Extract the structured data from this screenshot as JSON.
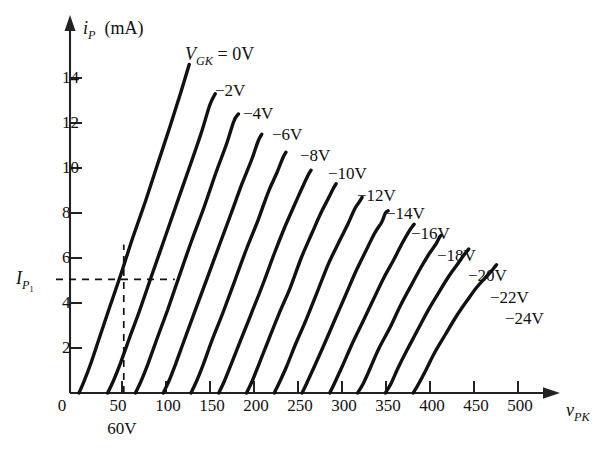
{
  "chart_data": {
    "type": "line",
    "title": "",
    "xlabel": "v_PK",
    "ylabel": "i_P (mA)",
    "xlim": [
      0,
      540
    ],
    "ylim": [
      0,
      15.5
    ],
    "grid": false,
    "legend": "inline-curve-labels",
    "x_axis_label_html": "v<sub>PK</sub>",
    "y_axis_label_html": "i<sub>P</sub> (mA)",
    "x_ticks": [
      0,
      50,
      100,
      150,
      200,
      250,
      300,
      350,
      400,
      450,
      500
    ],
    "y_ticks": [
      0,
      2,
      4,
      6,
      8,
      10,
      12,
      14
    ],
    "x_tick_labels": [
      "0",
      "50",
      "100",
      "150",
      "200",
      "250",
      "300",
      "350",
      "400",
      "450",
      "500"
    ],
    "y_tick_labels": [
      "0",
      "2",
      "4",
      "6",
      "8",
      "10",
      "12",
      "14"
    ],
    "parameter_name": "V_GK",
    "parameter_label_html": "V<sub>GK</sub> = 0V",
    "annotations": [
      {
        "name": "operating-point-voltage",
        "text": "60V",
        "x": 60,
        "y": 0
      },
      {
        "name": "operating-point-current",
        "text": "I_P1",
        "html": "I<sub>P<sub>1</sub></sub>",
        "x": 0,
        "y": 5.05
      }
    ],
    "construction_lines": {
      "vertical_x": 60,
      "horizontal_y": 5.05,
      "horizontal_x_end": 117
    },
    "series": [
      {
        "name": "0V",
        "label": "V_GK = 0V",
        "label_x": 185,
        "label_y": 44,
        "points": [
          [
            10,
            0
          ],
          [
            16,
            0.55
          ],
          [
            24,
            1.4
          ],
          [
            34,
            2.6
          ],
          [
            45,
            3.9
          ],
          [
            57,
            5.3
          ],
          [
            70,
            6.9
          ],
          [
            84,
            8.5
          ],
          [
            98,
            10.2
          ],
          [
            112,
            11.9
          ],
          [
            124,
            13.4
          ],
          [
            133,
            14.6
          ]
        ]
      },
      {
        "name": "-2V",
        "label": "−2V",
        "label_x": 215,
        "label_y": 81,
        "points": [
          [
            42,
            0
          ],
          [
            48,
            0.5
          ],
          [
            56,
            1.3
          ],
          [
            66,
            2.4
          ],
          [
            78,
            3.7
          ],
          [
            91,
            5.2
          ],
          [
            105,
            6.8
          ],
          [
            119,
            8.4
          ],
          [
            133,
            10.0
          ],
          [
            146,
            11.5
          ],
          [
            156,
            12.8
          ],
          [
            162,
            13.3
          ]
        ]
      },
      {
        "name": "-4V",
        "label": "−4V",
        "label_x": 243,
        "label_y": 104,
        "points": [
          [
            73,
            0
          ],
          [
            79,
            0.5
          ],
          [
            87,
            1.3
          ],
          [
            97,
            2.4
          ],
          [
            109,
            3.7
          ],
          [
            122,
            5.2
          ],
          [
            136,
            6.8
          ],
          [
            150,
            8.3
          ],
          [
            163,
            9.8
          ],
          [
            175,
            11.1
          ],
          [
            183,
            12.1
          ],
          [
            188,
            12.4
          ]
        ]
      },
      {
        "name": "-6V",
        "label": "−6V",
        "label_x": 272,
        "label_y": 125,
        "points": [
          [
            104,
            0
          ],
          [
            110,
            0.5
          ],
          [
            118,
            1.3
          ],
          [
            128,
            2.4
          ],
          [
            140,
            3.7
          ],
          [
            153,
            5.1
          ],
          [
            167,
            6.6
          ],
          [
            180,
            8.0
          ],
          [
            192,
            9.3
          ],
          [
            203,
            10.4
          ],
          [
            210,
            11.2
          ],
          [
            214,
            11.5
          ]
        ]
      },
      {
        "name": "-8V",
        "label": "−8V",
        "label_x": 300,
        "label_y": 146,
        "points": [
          [
            135,
            0
          ],
          [
            141,
            0.5
          ],
          [
            149,
            1.3
          ],
          [
            159,
            2.4
          ],
          [
            171,
            3.6
          ],
          [
            184,
            5.0
          ],
          [
            197,
            6.4
          ],
          [
            210,
            7.7
          ],
          [
            221,
            8.9
          ],
          [
            231,
            9.8
          ],
          [
            237,
            10.4
          ],
          [
            241,
            10.7
          ]
        ]
      },
      {
        "name": "-10V",
        "label": "−10V",
        "label_x": 328,
        "label_y": 164,
        "points": [
          [
            166,
            0
          ],
          [
            172,
            0.5
          ],
          [
            180,
            1.3
          ],
          [
            190,
            2.3
          ],
          [
            202,
            3.5
          ],
          [
            215,
            4.8
          ],
          [
            228,
            6.2
          ],
          [
            240,
            7.4
          ],
          [
            251,
            8.4
          ],
          [
            260,
            9.2
          ],
          [
            266,
            9.7
          ],
          [
            269,
            9.9
          ]
        ]
      },
      {
        "name": "-12V",
        "label": "−12V",
        "label_x": 357,
        "label_y": 186,
        "points": [
          [
            197,
            0
          ],
          [
            203,
            0.5
          ],
          [
            211,
            1.3
          ],
          [
            221,
            2.3
          ],
          [
            233,
            3.5
          ],
          [
            246,
            4.7
          ],
          [
            258,
            6.0
          ],
          [
            270,
            7.1
          ],
          [
            280,
            8.0
          ],
          [
            289,
            8.7
          ],
          [
            294,
            9.1
          ],
          [
            297,
            9.3
          ]
        ]
      },
      {
        "name": "-14V",
        "label": "−14V",
        "label_x": 386,
        "label_y": 204,
        "points": [
          [
            228,
            0
          ],
          [
            234,
            0.5
          ],
          [
            242,
            1.2
          ],
          [
            252,
            2.2
          ],
          [
            264,
            3.3
          ],
          [
            276,
            4.5
          ],
          [
            288,
            5.7
          ],
          [
            300,
            6.7
          ],
          [
            310,
            7.5
          ],
          [
            318,
            8.2
          ],
          [
            323,
            8.5
          ],
          [
            326,
            8.7
          ]
        ]
      },
      {
        "name": "-16V",
        "label": "−16V",
        "label_x": 411,
        "label_y": 224,
        "points": [
          [
            259,
            0
          ],
          [
            265,
            0.5
          ],
          [
            273,
            1.2
          ],
          [
            283,
            2.1
          ],
          [
            295,
            3.2
          ],
          [
            307,
            4.3
          ],
          [
            319,
            5.4
          ],
          [
            330,
            6.3
          ],
          [
            340,
            7.1
          ],
          [
            348,
            7.6
          ],
          [
            352,
            8.0
          ],
          [
            355,
            8.1
          ]
        ]
      },
      {
        "name": "-18V",
        "label": "−18V",
        "label_x": 437,
        "label_y": 246,
        "points": [
          [
            290,
            0
          ],
          [
            296,
            0.5
          ],
          [
            304,
            1.2
          ],
          [
            314,
            2.1
          ],
          [
            326,
            3.1
          ],
          [
            338,
            4.1
          ],
          [
            350,
            5.1
          ],
          [
            361,
            5.9
          ],
          [
            370,
            6.6
          ],
          [
            377,
            7.1
          ],
          [
            382,
            7.4
          ],
          [
            384,
            7.5
          ]
        ]
      },
      {
        "name": "-20V",
        "label": "−20V",
        "label_x": 468,
        "label_y": 266,
        "points": [
          [
            321,
            0
          ],
          [
            327,
            0.4
          ],
          [
            335,
            1.1
          ],
          [
            345,
            2.0
          ],
          [
            357,
            2.9
          ],
          [
            369,
            3.9
          ],
          [
            381,
            4.8
          ],
          [
            392,
            5.6
          ],
          [
            401,
            6.2
          ],
          [
            408,
            6.6
          ],
          [
            412,
            6.9
          ],
          [
            414,
            7.0
          ]
        ]
      },
      {
        "name": "-22V",
        "label": "−22V",
        "label_x": 490,
        "label_y": 288,
        "points": [
          [
            352,
            0
          ],
          [
            358,
            0.4
          ],
          [
            366,
            1.1
          ],
          [
            376,
            1.9
          ],
          [
            388,
            2.8
          ],
          [
            400,
            3.7
          ],
          [
            412,
            4.5
          ],
          [
            423,
            5.2
          ],
          [
            432,
            5.7
          ],
          [
            439,
            6.1
          ],
          [
            443,
            6.3
          ],
          [
            445,
            6.4
          ]
        ]
      },
      {
        "name": "-24V",
        "label": "−24V",
        "label_x": 505,
        "label_y": 309,
        "points": [
          [
            383,
            0
          ],
          [
            389,
            0.4
          ],
          [
            397,
            1.0
          ],
          [
            407,
            1.8
          ],
          [
            419,
            2.6
          ],
          [
            431,
            3.4
          ],
          [
            443,
            4.1
          ],
          [
            454,
            4.7
          ],
          [
            463,
            5.1
          ],
          [
            470,
            5.4
          ],
          [
            474,
            5.6
          ],
          [
            476,
            5.7
          ]
        ]
      }
    ]
  },
  "axes": {
    "y_axis_caption": "i",
    "y_axis_sub": "P",
    "y_axis_unit": "(mA)",
    "x_axis_caption": "v",
    "x_axis_sub": "PK",
    "param_prefix": "V",
    "param_sub": "GK",
    "param_value": "= 0V",
    "ip1_main": "I",
    "ip1_sub": "P",
    "ip1_subsub": "1",
    "bias_point_label": "60V"
  },
  "colors": {
    "curve": "#111111",
    "axis": "#222222",
    "background": "#ffffff",
    "text": "#111111"
  }
}
